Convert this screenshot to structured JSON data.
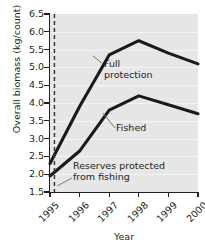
{
  "chart_data": {
    "type": "line",
    "title": "",
    "xlabel": "Year",
    "ylabel": "Overall biomass (kg/count)",
    "categories": [
      "1995",
      "1996",
      "1997",
      "1998",
      "1999",
      "2000"
    ],
    "x": [
      1995,
      1996,
      1997,
      1998,
      1999,
      2000
    ],
    "xlim": [
      1995,
      2000
    ],
    "ylim": [
      1.5,
      6.5
    ],
    "yticks": [
      "6.5",
      "6.0",
      "5.5",
      "5.0",
      "4.5",
      "4.0",
      "3.5",
      "3.0",
      "2.5",
      "2.0",
      "1.5"
    ],
    "ytick_values": [
      6.5,
      6.0,
      5.5,
      5.0,
      4.5,
      4.0,
      3.5,
      3.0,
      2.5,
      2.0,
      1.5
    ],
    "grid": true,
    "legend": "inline-annotations",
    "series": [
      {
        "name": "Full protection",
        "values": [
          2.3,
          3.9,
          5.35,
          5.75,
          5.4,
          5.1
        ],
        "color": "#1a1a1a"
      },
      {
        "name": "Fished",
        "values": [
          1.95,
          2.65,
          3.8,
          4.2,
          3.95,
          3.7
        ],
        "color": "#1a1a1a"
      }
    ],
    "annotations": [
      {
        "name": "full-protection",
        "text": "Full\nprotection",
        "line1": "Full",
        "line2": "protection"
      },
      {
        "name": "fished",
        "text": "Fished"
      },
      {
        "name": "reserves-protected",
        "text": "Reserves protected\nfrom fishing",
        "line1": "Reserves protected",
        "line2": "from fishing"
      }
    ],
    "marker_line": {
      "name": "reserves-protected-marker",
      "style": "dashed",
      "x": 1995.15
    },
    "plot_background": "#e6e6e6",
    "gridline_color": "#f4f4f4"
  }
}
